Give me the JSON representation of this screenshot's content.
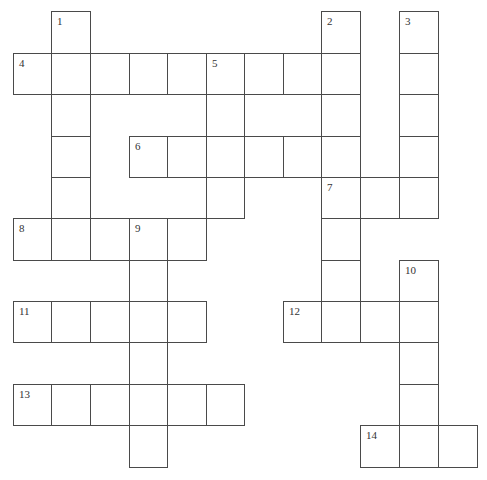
{
  "puzzle": {
    "grid": {
      "origin_x": 13,
      "origin_y": 11,
      "col_lines": [
        13,
        51,
        90,
        129,
        167,
        206,
        244,
        283,
        321,
        360,
        399,
        438,
        477
      ],
      "row_lines": [
        11,
        53,
        94,
        136,
        177,
        218,
        260,
        301,
        342,
        384,
        425,
        467
      ],
      "line_color": "#4a4a4a"
    },
    "entries": [
      {
        "number": "1",
        "direction": "down",
        "row": 0,
        "col": 1,
        "length": 6
      },
      {
        "number": "2",
        "direction": "down",
        "row": 0,
        "col": 8,
        "length": 4
      },
      {
        "number": "3",
        "direction": "down",
        "row": 0,
        "col": 10,
        "length": 5
      },
      {
        "number": "4",
        "direction": "across",
        "row": 1,
        "col": 0,
        "length": 9
      },
      {
        "number": "5",
        "direction": "down",
        "row": 1,
        "col": 5,
        "length": 4
      },
      {
        "number": "6",
        "direction": "across",
        "row": 3,
        "col": 3,
        "length": 6
      },
      {
        "number": "7",
        "direction": "across",
        "row": 4,
        "col": 8,
        "length": 3
      },
      {
        "number": "7",
        "direction": "down",
        "row": 4,
        "col": 8,
        "length": 4
      },
      {
        "number": "8",
        "direction": "across",
        "row": 5,
        "col": 0,
        "length": 5
      },
      {
        "number": "9",
        "direction": "down",
        "row": 5,
        "col": 3,
        "length": 6
      },
      {
        "number": "10",
        "direction": "down",
        "row": 6,
        "col": 10,
        "length": 5
      },
      {
        "number": "11",
        "direction": "across",
        "row": 7,
        "col": 0,
        "length": 5
      },
      {
        "number": "12",
        "direction": "across",
        "row": 7,
        "col": 7,
        "length": 4
      },
      {
        "number": "13",
        "direction": "across",
        "row": 9,
        "col": 0,
        "length": 6
      },
      {
        "number": "14",
        "direction": "across",
        "row": 10,
        "col": 9,
        "length": 3
      }
    ]
  }
}
